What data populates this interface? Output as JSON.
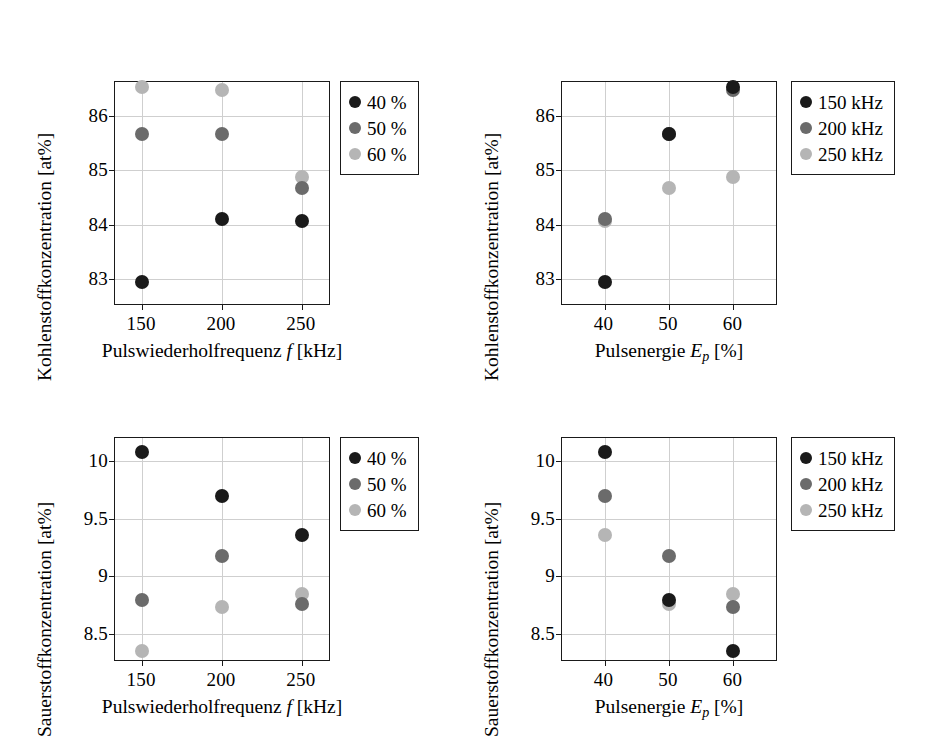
{
  "figure": {
    "colors": {
      "series_dark": "#1a1a1a",
      "series_mid": "#6b6b6b",
      "series_light": "#b5b5b5",
      "axis": "#1a1a1a",
      "grid": "#cfcfcf",
      "background": "#ffffff"
    }
  },
  "axis_titles": {
    "carbon": "Kohlenstoffkonzentration [at%]",
    "oxygen": "Sauerstoffkonzentration [at%]",
    "frequency_x": "Pulswiederholfrequenz f [kHz]",
    "energy_x": "Pulsenergie Ep [%]",
    "frequency_x_plain": "Pulswiederholfrequenz",
    "frequency_x_symbol": "f",
    "frequency_x_unit": "[kHz]",
    "energy_x_plain": "Pulsenergie",
    "energy_x_symbol": "E",
    "energy_x_symbol_sub": "p",
    "energy_x_unit": "[%]"
  },
  "legends": {
    "pulse_energy": {
      "title": "Pulsenergie",
      "entries": [
        {
          "label": "40 %",
          "color": "#1a1a1a"
        },
        {
          "label": "50 %",
          "color": "#6b6b6b"
        },
        {
          "label": "60 %",
          "color": "#b5b5b5"
        }
      ]
    },
    "frequency": {
      "title": "Pulswiederholfrequenz",
      "entries": [
        {
          "label": "150 kHz",
          "color": "#1a1a1a"
        },
        {
          "label": "200 kHz",
          "color": "#6b6b6b"
        },
        {
          "label": "250 kHz",
          "color": "#b5b5b5"
        }
      ]
    }
  },
  "chart_data": [
    {
      "id": "carbon-vs-frequency",
      "type": "scatter",
      "title": "",
      "xlabel": "Pulswiederholfrequenz f [kHz]",
      "ylabel": "Kohlenstoffkonzentration [at%]",
      "x": [
        150,
        200,
        250
      ],
      "xticks": [
        "150",
        "200",
        "250"
      ],
      "xlim": [
        133,
        267
      ],
      "yticks": [
        "86",
        "85",
        "84",
        "83"
      ],
      "ytickvals": [
        86,
        85,
        84,
        83
      ],
      "ylim": [
        82.55,
        86.62
      ],
      "grid": true,
      "legend_position": "outside-right-top",
      "series": [
        {
          "name": "40 %",
          "color": "#1a1a1a",
          "values": [
            82.95,
            84.1,
            84.08
          ]
        },
        {
          "name": "50 %",
          "color": "#6b6b6b",
          "values": [
            85.67,
            85.67,
            84.67
          ]
        },
        {
          "name": "60 %",
          "color": "#b5b5b5",
          "values": [
            86.53,
            86.47,
            84.88
          ]
        }
      ]
    },
    {
      "id": "carbon-vs-pulse-energy",
      "type": "scatter",
      "title": "",
      "xlabel": "Pulsenergie Ep [%]",
      "ylabel": "Kohlenstoffkonzentration [at%]",
      "x": [
        40,
        50,
        60
      ],
      "xticks": [
        "40",
        "50",
        "60"
      ],
      "xlim": [
        33.4,
        66.6
      ],
      "yticks": [
        "86",
        "85",
        "84",
        "83"
      ],
      "ytickvals": [
        86,
        85,
        84,
        83
      ],
      "ylim": [
        82.55,
        86.62
      ],
      "grid": true,
      "legend_position": "outside-right-top",
      "series": [
        {
          "name": "150 kHz",
          "color": "#1a1a1a",
          "values": [
            82.95,
            85.67,
            86.53
          ]
        },
        {
          "name": "200 kHz",
          "color": "#6b6b6b",
          "values": [
            84.1,
            85.67,
            86.47
          ]
        },
        {
          "name": "250 kHz",
          "color": "#b5b5b5",
          "values": [
            84.08,
            84.67,
            84.88
          ]
        }
      ]
    },
    {
      "id": "oxygen-vs-frequency",
      "type": "scatter",
      "title": "",
      "xlabel": "Pulswiederholfrequenz f [kHz]",
      "ylabel": "Sauerstoffkonzentration [at%]",
      "x": [
        150,
        200,
        250
      ],
      "xticks": [
        "150",
        "200",
        "250"
      ],
      "xlim": [
        133,
        267
      ],
      "yticks": [
        "10",
        "9.5",
        "9",
        "8.5"
      ],
      "ytickvals": [
        10,
        9.5,
        9,
        8.5
      ],
      "ylim": [
        8.27,
        10.2
      ],
      "grid": true,
      "legend_position": "outside-right-top",
      "series": [
        {
          "name": "40 %",
          "color": "#1a1a1a",
          "values": [
            10.08,
            9.7,
            9.36
          ]
        },
        {
          "name": "50 %",
          "color": "#6b6b6b",
          "values": [
            8.79,
            9.17,
            8.76
          ]
        },
        {
          "name": "60 %",
          "color": "#b5b5b5",
          "values": [
            8.35,
            8.73,
            8.84
          ]
        }
      ]
    },
    {
      "id": "oxygen-vs-pulse-energy",
      "type": "scatter",
      "title": "",
      "xlabel": "Pulsenergie Ep [%]",
      "ylabel": "Sauerstoffkonzentration [at%]",
      "x": [
        40,
        50,
        60
      ],
      "xticks": [
        "40",
        "50",
        "60"
      ],
      "xlim": [
        33.4,
        66.6
      ],
      "yticks": [
        "10",
        "9.5",
        "9",
        "8.5"
      ],
      "ytickvals": [
        10,
        9.5,
        9,
        8.5
      ],
      "ylim": [
        8.27,
        10.2
      ],
      "grid": true,
      "legend_position": "outside-right-top",
      "series": [
        {
          "name": "150 kHz",
          "color": "#1a1a1a",
          "values": [
            10.08,
            8.79,
            8.35
          ]
        },
        {
          "name": "200 kHz",
          "color": "#6b6b6b",
          "values": [
            9.7,
            9.17,
            8.73
          ]
        },
        {
          "name": "250 kHz",
          "color": "#b5b5b5",
          "values": [
            9.36,
            8.76,
            8.84
          ]
        }
      ]
    }
  ]
}
